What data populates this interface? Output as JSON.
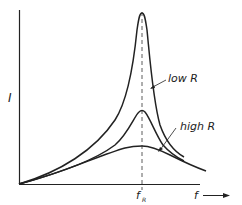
{
  "diagram": {
    "y_axis_label": "I",
    "x_axis_label": "f",
    "resonance_label": "f",
    "resonance_subscript": "R",
    "curves": [
      {
        "name": "low R",
        "label": "low R"
      },
      {
        "name": "medium R",
        "label": ""
      },
      {
        "name": "high R",
        "label": "high R"
      }
    ],
    "colors": {
      "line": "#222222",
      "background": "#ffffff"
    }
  }
}
